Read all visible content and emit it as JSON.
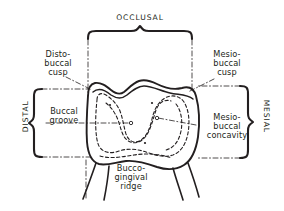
{
  "figure": {
    "kind": "dental-anatomy-line-drawing",
    "background_color": "#ffffff",
    "ink_color": "#231f20"
  },
  "labels": {
    "occlusal": "OCCLUSAL",
    "distal": "DISTAL",
    "mesial": "MESIAL",
    "disto_buccal_cusp": "Disto-\nbuccal\ncusp",
    "mesio_buccal_cusp": "Mesio-\nbuccal\ncusp",
    "buccal_groove": "Buccal\ngroove",
    "mesio_buccal_concavity": "Mesio-\nbuccal\nconcavity",
    "bucco_gingival_ridge": "Bucco-\ngingival\nridge"
  },
  "braces": {
    "occlusal_orientation": "horizontal-top-peak-up",
    "distal_orientation": "vertical-left-peak-left",
    "mesial_orientation": "vertical-right-peak-right"
  },
  "leaders": {
    "style": "dash-dot",
    "targets": [
      "disto-buccal cusp tip",
      "mesio-buccal cusp tip",
      "buccal groove",
      "mesio-buccal concavity",
      "bucco-gingival ridge"
    ]
  }
}
